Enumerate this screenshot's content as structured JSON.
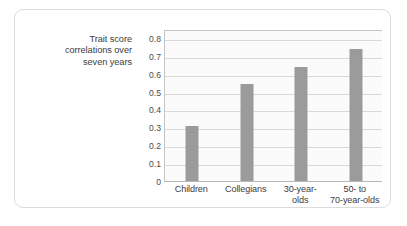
{
  "figure": {
    "axis_caption_lines": [
      "Trait score",
      "correlations over",
      "seven years"
    ],
    "bar_color": "#9b9b9b",
    "gridline_color": "#d9d9d9",
    "plot_background": "#fbfbfb",
    "border_color": "#dcdcdc"
  },
  "chart_data": {
    "type": "bar",
    "title": "",
    "xlabel": "",
    "ylabel": "Trait score correlations over seven years",
    "categories": [
      "Children",
      "Collegians",
      "30-year-olds",
      "50- to 70-year-olds"
    ],
    "category_label_lines": [
      [
        "Children"
      ],
      [
        "Collegians"
      ],
      [
        "30-year-",
        "olds"
      ],
      [
        "50- to",
        "70-year-olds"
      ]
    ],
    "values": [
      0.31,
      0.54,
      0.64,
      0.74
    ],
    "ylim": [
      0,
      0.85
    ],
    "ytick_values": [
      0,
      0.1,
      0.2,
      0.3,
      0.4,
      0.5,
      0.6,
      0.7,
      0.8
    ],
    "ytick_labels": [
      "0",
      "0.1",
      "0.2",
      "0.3",
      "0.4",
      "0.5",
      "0.6",
      "0.7",
      "0.8"
    ],
    "grid": true,
    "legend": "none"
  }
}
